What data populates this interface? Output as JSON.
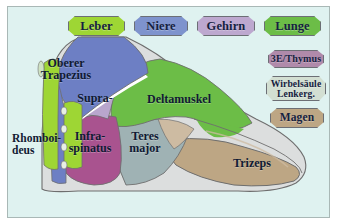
{
  "figure": {
    "background_color": "#dff2f0",
    "border_color": "#a9b8b6"
  },
  "organ_badges_top": [
    {
      "label": "Leber",
      "color": "#9ed634"
    },
    {
      "label": "Niere",
      "color": "#7e93cd"
    },
    {
      "label": "Gehirn",
      "color": "#bda8cf"
    },
    {
      "label": "Lunge",
      "color": "#6cbd47"
    }
  ],
  "organ_badges_side": [
    {
      "label": "3E/Thymus",
      "color": "#b08aaa"
    },
    {
      "label": "Wirbelsäule\nLenkerg.",
      "color": "#d3dfd2"
    },
    {
      "label": "Magen",
      "color": "#bda684"
    }
  ],
  "muscle_labels": [
    {
      "label": "Oberer\nTrapezius",
      "color": "#6d7fc4"
    },
    {
      "label": "Supra-",
      "color": "#b9a6cd"
    },
    {
      "label": "Deltamuskel",
      "color": "#6cbd47"
    },
    {
      "label": "Rhomboi-\ndeus",
      "color": "#9ed634"
    },
    {
      "label": "Infra-\nspinatus",
      "color": "#a9538f"
    },
    {
      "label": "Teres\nmajor",
      "color": "#9fb2b4"
    },
    {
      "label": "Trizeps",
      "color": "#bda684"
    }
  ]
}
